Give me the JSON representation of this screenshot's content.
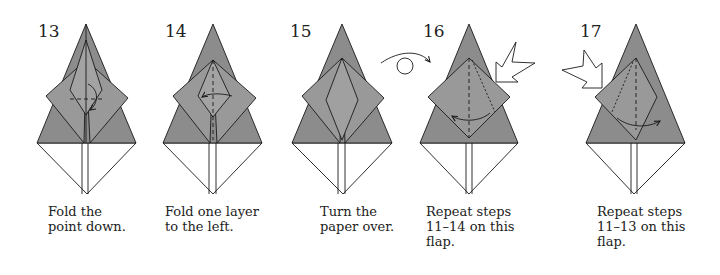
{
  "colors": {
    "paper_gray": "#8c8c8c",
    "paper_white": "#ffffff",
    "line": "#1a1a1a"
  },
  "steps": [
    {
      "number": "13",
      "caption": "Fold the\npoint down.",
      "icons": [
        "valley-fold-line",
        "fold-arrow-down"
      ]
    },
    {
      "number": "14",
      "caption": "Fold one layer\nto the left.",
      "icons": [
        "valley-fold-line",
        "fold-arrow-left"
      ]
    },
    {
      "number": "15",
      "caption": "Turn the\npaper over.",
      "icons": []
    },
    {
      "number": "16",
      "caption": "Repeat steps\n11–14 on this\nflap.",
      "icons": [
        "turn-over-icon",
        "repeat-arrow-icon",
        "valley-fold-line",
        "fold-arrow-left"
      ]
    },
    {
      "number": "17",
      "caption": "Repeat steps\n11–13 on this\nflap.",
      "icons": [
        "repeat-arrow-icon",
        "valley-fold-line",
        "fold-arrow-right"
      ]
    }
  ]
}
